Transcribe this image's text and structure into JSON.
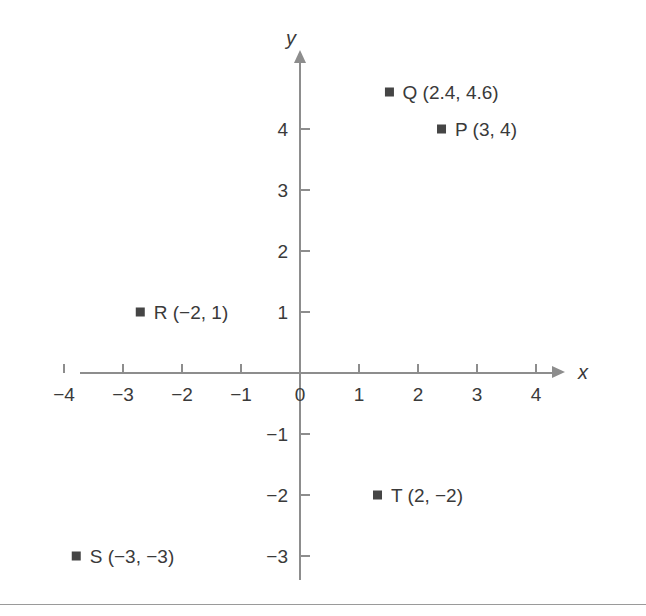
{
  "chart_data": {
    "type": "scatter",
    "title": "",
    "xlabel": "x",
    "ylabel": "y",
    "xlim": [
      -4.5,
      4.7
    ],
    "ylim": [
      -3.6,
      4.9
    ],
    "grid": false,
    "legend": "none",
    "x_ticks": [
      {
        "value": -4,
        "label": "−4"
      },
      {
        "value": -3,
        "label": "−3"
      },
      {
        "value": -2,
        "label": "−2"
      },
      {
        "value": -1,
        "label": "−1"
      },
      {
        "value": 0,
        "label": "0"
      },
      {
        "value": 1,
        "label": "1"
      },
      {
        "value": 2,
        "label": "2"
      },
      {
        "value": 3,
        "label": "3"
      },
      {
        "value": 4,
        "label": "4"
      }
    ],
    "y_ticks": [
      {
        "value": 4,
        "label": "4"
      },
      {
        "value": 3,
        "label": "3"
      },
      {
        "value": 2,
        "label": "2"
      },
      {
        "value": 1,
        "label": "1"
      },
      {
        "value": -1,
        "label": "−1"
      },
      {
        "value": -2,
        "label": "−2"
      },
      {
        "value": -3,
        "label": "−3"
      }
    ],
    "points": [
      {
        "name": "Q",
        "x": 2.4,
        "y": 4.6,
        "label": "Q (2.4, 4.6)",
        "label_side": "right"
      },
      {
        "name": "P",
        "x": 3,
        "y": 4,
        "label": "P (3, 4)",
        "label_side": "right"
      },
      {
        "name": "R",
        "x": -2,
        "y": 1,
        "label": "R (−2, 1)",
        "label_side": "right"
      },
      {
        "name": "T",
        "x": 2,
        "y": -2,
        "label": "T (2, −2)",
        "label_side": "right"
      },
      {
        "name": "S",
        "x": -3,
        "y": -3,
        "label": "S (−3, −3)",
        "label_side": "right"
      }
    ],
    "colors": {
      "marker": "#454545",
      "axis": "#8d8d8d",
      "text": "#3a3a3a",
      "background": "#ffffff"
    }
  }
}
